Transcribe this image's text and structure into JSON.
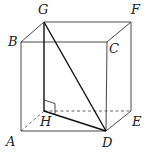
{
  "figure": {
    "type": "cuboid-with-triangle",
    "vertices": {
      "G": {
        "x": 44,
        "y": 22,
        "label": "G",
        "lx": 38,
        "ly": 14
      },
      "F": {
        "x": 131,
        "y": 22,
        "label": "F",
        "lx": 131,
        "ly": 14
      },
      "B": {
        "x": 21,
        "y": 42,
        "label": "B",
        "lx": 8,
        "ly": 46
      },
      "C": {
        "x": 107,
        "y": 42,
        "label": "C",
        "lx": 109,
        "ly": 53
      },
      "H": {
        "x": 44,
        "y": 111,
        "label": "H",
        "lx": 40,
        "ly": 126
      },
      "E": {
        "x": 131,
        "y": 111,
        "label": "E",
        "lx": 132,
        "ly": 126
      },
      "A": {
        "x": 21,
        "y": 131,
        "label": "A",
        "lx": 6,
        "ly": 146
      },
      "D": {
        "x": 106,
        "y": 131,
        "label": "D",
        "lx": 102,
        "ly": 147
      }
    },
    "visible_edges": [
      [
        "B",
        "C"
      ],
      [
        "G",
        "F"
      ],
      [
        "B",
        "G"
      ],
      [
        "C",
        "F"
      ],
      [
        "B",
        "A"
      ],
      [
        "C",
        "D"
      ],
      [
        "F",
        "E"
      ],
      [
        "A",
        "D"
      ],
      [
        "D",
        "E"
      ]
    ],
    "hidden_edges": [
      [
        "A",
        "H"
      ],
      [
        "H",
        "E"
      ]
    ],
    "highlighted_edges": [
      [
        "G",
        "H"
      ],
      [
        "G",
        "D"
      ],
      [
        "H",
        "D"
      ]
    ],
    "right_angle_at": "H",
    "labels": [
      "A",
      "B",
      "C",
      "D",
      "E",
      "F",
      "G",
      "H"
    ]
  }
}
